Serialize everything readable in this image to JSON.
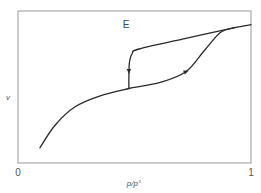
{
  "chart_data": {
    "type": "line",
    "title": "",
    "annotation": "E",
    "xlabel": "p/p°",
    "ylabel": "v",
    "xlim": [
      0,
      1
    ],
    "ylim": [
      0,
      1
    ],
    "x_tick_labels": [
      "0",
      "1"
    ],
    "grid": false,
    "legend": "none",
    "series": [
      {
        "name": "adsorption",
        "direction_marker_at": 0.72,
        "points": [
          [
            0.094,
            0.1
          ],
          [
            0.16,
            0.25
          ],
          [
            0.245,
            0.37
          ],
          [
            0.35,
            0.44
          ],
          [
            0.476,
            0.49
          ],
          [
            0.61,
            0.53
          ],
          [
            0.72,
            0.6
          ],
          [
            0.8,
            0.74
          ],
          [
            0.87,
            0.86
          ],
          [
            0.93,
            0.89
          ],
          [
            1.0,
            0.91
          ]
        ]
      },
      {
        "name": "desorption",
        "direction_marker_at": 0.476,
        "points": [
          [
            0.93,
            0.89
          ],
          [
            0.72,
            0.82
          ],
          [
            0.52,
            0.75
          ],
          [
            0.49,
            0.72
          ],
          [
            0.478,
            0.66
          ],
          [
            0.476,
            0.58
          ],
          [
            0.476,
            0.49
          ]
        ]
      }
    ]
  }
}
